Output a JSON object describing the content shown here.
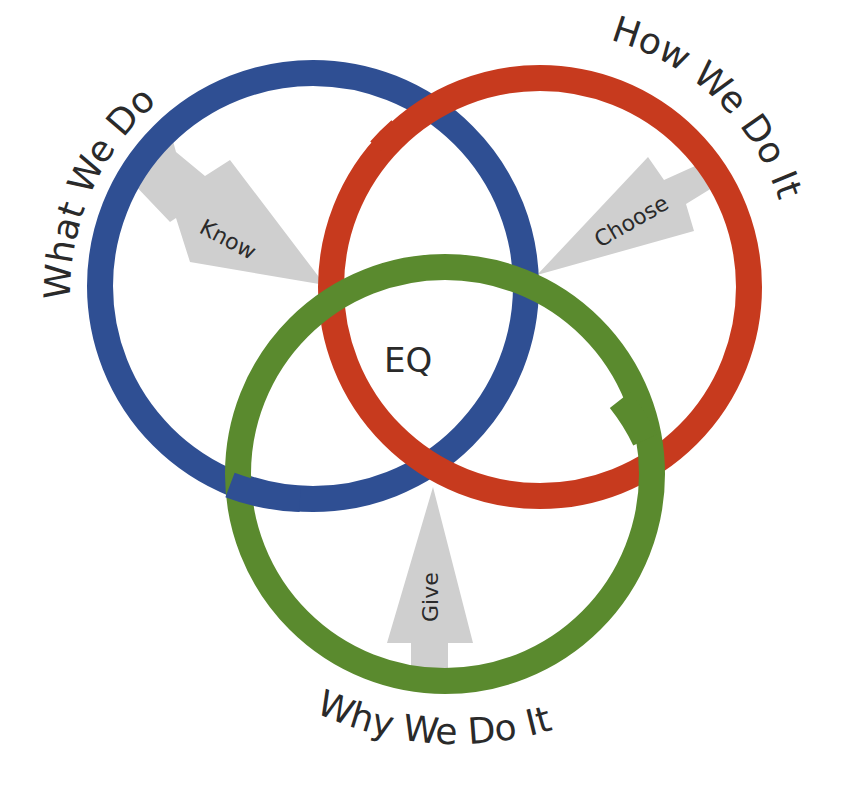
{
  "diagram": {
    "type": "venn",
    "circles": [
      {
        "id": "what",
        "label": "What We Do",
        "color": "#2f4f93",
        "arrow_label": "Know"
      },
      {
        "id": "how",
        "label": "How We Do It",
        "color": "#c73a1e",
        "arrow_label": "Choose"
      },
      {
        "id": "why",
        "label": "Why We Do It",
        "color": "#5a8a2e",
        "arrow_label": "Give"
      }
    ],
    "center_label": "EQ",
    "arrow_color": "#cfcfcf",
    "text_color": "#2a2a2a"
  }
}
